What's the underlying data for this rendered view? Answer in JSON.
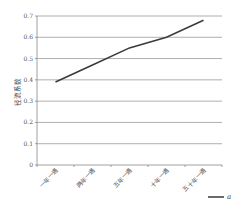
{
  "chart_data": {
    "type": "line",
    "title": "",
    "xlabel": "",
    "ylabel": "径流系数",
    "categories": [
      "一年一遇",
      "两年一遇",
      "五年一遇",
      "十年一遇",
      "五十年一遇"
    ],
    "series": [
      {
        "name": "a",
        "values": [
          0.39,
          0.47,
          0.55,
          0.6,
          0.68
        ],
        "color": "#3a3a3a"
      }
    ],
    "ylim": [
      0,
      0.7
    ],
    "yticks": [
      "0",
      "0.1",
      "0.2",
      "0.3",
      "0.4",
      "0.5",
      "0.6",
      "0.7"
    ],
    "grid": true,
    "legend_position": "bottom-right"
  },
  "colors": {
    "line": "#3a3a3a",
    "grid": "#9a9a9a",
    "axis": "#888888"
  }
}
